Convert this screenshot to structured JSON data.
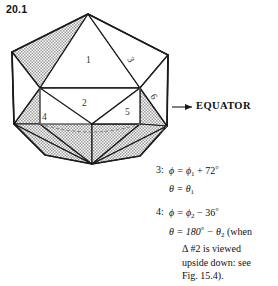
{
  "figure": {
    "number": "20.1",
    "caption_labels": {
      "equator": "EQUATOR"
    }
  },
  "face_labels": [
    {
      "id": "face-1",
      "text": "1",
      "x": 86,
      "y": 60
    },
    {
      "id": "face-2",
      "text": "2",
      "x": 84,
      "y": 103
    },
    {
      "id": "face-3",
      "text": "3",
      "x": 127,
      "y": 57
    },
    {
      "id": "face-4",
      "text": "4",
      "x": 44,
      "y": 117
    },
    {
      "id": "face-5",
      "text": "5",
      "x": 127,
      "y": 112
    },
    {
      "id": "face-6",
      "text": "6",
      "x": 150,
      "y": 93
    }
  ],
  "notes": [
    {
      "key": "3:",
      "line1_pre": "ϕ = ϕ",
      "line1_sub": "1",
      "line1_post": " + 72",
      "line1_deg": "°",
      "line2_pre": "θ = θ",
      "line2_sub": "1",
      "line2_post": ""
    },
    {
      "key": "4:",
      "line1_pre": "ϕ = ϕ",
      "line1_sub": "2",
      "line1_post": " − 36",
      "line1_deg": "°",
      "line2_pre": "θ = 180",
      "line2_deg1": "°",
      "line2_mid": " − θ",
      "line2_sub": "2",
      "line2_post": " (when",
      "line3": "Δ #2 is viewed",
      "line4": "upside down: see",
      "line5": "Fig. 15.4)."
    }
  ],
  "colors": {
    "shade_fill": "#b9b9b9",
    "light_fill": "#ffffff",
    "stroke": "#1a1a1a",
    "text": "#111111",
    "background": "#ffffff"
  },
  "geometry": {
    "apex_top": [
      88,
      14
    ],
    "apex_bottom": [
      92,
      164
    ],
    "upper_ring_y": 88,
    "lower_ring_y": 124
  }
}
